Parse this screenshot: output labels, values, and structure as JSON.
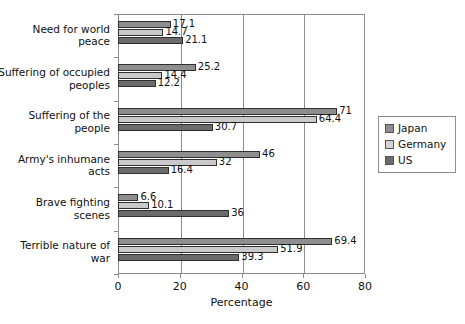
{
  "chart_data": {
    "type": "bar",
    "orientation": "horizontal",
    "title": "",
    "xlabel": "Percentage",
    "ylabel": "",
    "xlim": [
      0,
      80
    ],
    "xticks": [
      0,
      20,
      40,
      60,
      80
    ],
    "grid": true,
    "legend_position": "right",
    "categories": [
      "Need for world peace",
      "Suffering of occupied peoples",
      "Suffering of the people",
      "Army's inhumane acts",
      "Brave fighting scenes",
      "Terrible nature of war"
    ],
    "series": [
      {
        "name": "Japan",
        "color": "#8e8e8e",
        "values": [
          17.1,
          25.2,
          71,
          46,
          6.6,
          69.4
        ]
      },
      {
        "name": "Germany",
        "color": "#d3d3d3",
        "values": [
          14.7,
          14.4,
          64.4,
          32,
          10.1,
          51.9
        ]
      },
      {
        "name": "US",
        "color": "#6b6b6b",
        "values": [
          21.1,
          12.2,
          30.7,
          16.4,
          36,
          39.3
        ]
      }
    ],
    "value_labels": [
      [
        "17.1",
        "14.7",
        "21.1"
      ],
      [
        "25.2",
        "14.4",
        "12.2"
      ],
      [
        "71",
        "64.4",
        "30.7"
      ],
      [
        "46",
        "32",
        "16.4"
      ],
      [
        "6.6",
        "10.1",
        "36"
      ],
      [
        "69.4",
        "51.9",
        "39.3"
      ]
    ]
  },
  "axis": {
    "x_title": "Percentage",
    "tick_labels": [
      "0",
      "20",
      "40",
      "60",
      "80"
    ]
  },
  "legend": {
    "items": [
      {
        "label": "Japan"
      },
      {
        "label": "Germany"
      },
      {
        "label": "US"
      }
    ]
  },
  "caption": {
    "text": ""
  }
}
